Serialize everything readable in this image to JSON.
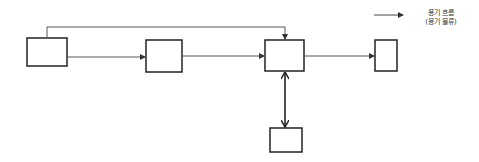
{
  "legend": {
    "line1": "용기 흐름",
    "line2": "(용기 물류)",
    "arrow_color": "#333333"
  },
  "colors": {
    "box_stroke": "#222222",
    "flow_line": "#555555",
    "double_arrow": "#222222"
  },
  "nodes": [
    {
      "id": "A",
      "label": ""
    },
    {
      "id": "B",
      "label": ""
    },
    {
      "id": "C",
      "label": ""
    },
    {
      "id": "D",
      "label": ""
    },
    {
      "id": "E",
      "label": ""
    }
  ],
  "edges": [
    {
      "from": "A",
      "to": "B",
      "type": "flow"
    },
    {
      "from": "B",
      "to": "C",
      "type": "flow"
    },
    {
      "from": "C",
      "to": "D",
      "type": "flow"
    },
    {
      "from": "A",
      "to": "C",
      "type": "flow",
      "route": "over-top"
    },
    {
      "from": "C",
      "to": "E",
      "type": "bidirectional"
    }
  ]
}
